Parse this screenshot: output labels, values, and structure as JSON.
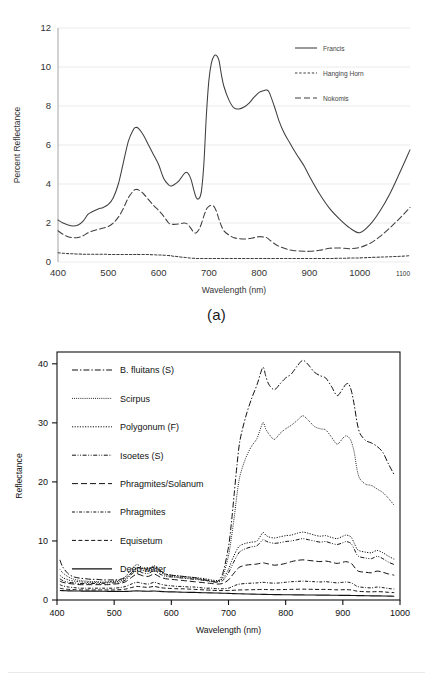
{
  "figure": {
    "panel_a_caption": "(a)",
    "panel_b_caption": "(b)"
  },
  "colors": {
    "ink": "#3f3f3f",
    "ink_dark": "#111111",
    "grid": "#e2e2e2",
    "axis": "#8a8a8a",
    "background": "#ffffff"
  },
  "chart_data": [
    {
      "id": "panel-a",
      "type": "line",
      "title": "",
      "xlabel": "Wavelength (nm)",
      "ylabel": "Percent Reflectance",
      "xlim": [
        400,
        1100
      ],
      "ylim": [
        0,
        12
      ],
      "xticks": [
        400,
        500,
        600,
        700,
        800,
        900,
        1000,
        1100
      ],
      "yticks": [
        0,
        2,
        4,
        6,
        8,
        10,
        12
      ],
      "grid": "horizontal",
      "legend_position": "top-right",
      "x": [
        400,
        410,
        420,
        430,
        440,
        450,
        460,
        470,
        480,
        490,
        500,
        510,
        520,
        530,
        540,
        550,
        555,
        560,
        570,
        580,
        590,
        600,
        610,
        620,
        625,
        630,
        640,
        650,
        655,
        660,
        665,
        670,
        675,
        680,
        685,
        690,
        695,
        700,
        705,
        710,
        715,
        720,
        725,
        730,
        740,
        750,
        760,
        770,
        780,
        790,
        800,
        810,
        815,
        820,
        830,
        840,
        850,
        860,
        870,
        880,
        890,
        900,
        920,
        940,
        960,
        980,
        1000,
        1020,
        1040,
        1060,
        1080,
        1100
      ],
      "series": [
        {
          "name": "Francis",
          "style": "solid",
          "values": [
            2.15,
            2.0,
            1.9,
            1.85,
            1.9,
            2.1,
            2.45,
            2.6,
            2.72,
            2.8,
            2.95,
            3.3,
            4.0,
            5.1,
            6.2,
            6.8,
            6.9,
            6.85,
            6.5,
            6.0,
            5.5,
            5.0,
            4.3,
            3.95,
            3.9,
            3.95,
            4.15,
            4.5,
            4.6,
            4.5,
            4.2,
            3.7,
            3.3,
            3.25,
            3.6,
            5.0,
            7.5,
            9.3,
            10.2,
            10.55,
            10.6,
            10.35,
            9.6,
            9.0,
            8.3,
            7.9,
            7.85,
            7.95,
            8.15,
            8.45,
            8.7,
            8.8,
            8.82,
            8.7,
            8.0,
            7.2,
            6.6,
            6.15,
            5.7,
            5.3,
            4.9,
            4.4,
            3.5,
            2.75,
            2.2,
            1.75,
            1.5,
            1.9,
            2.6,
            3.5,
            4.6,
            5.75
          ],
          "peaks": [
            {
              "x": 555,
              "y": 6.9
            },
            {
              "x": 715,
              "y": 10.6
            },
            {
              "x": 815,
              "y": 8.82
            }
          ],
          "minima": [
            {
              "x": 430,
              "y": 1.85
            },
            {
              "x": 675,
              "y": 3.25
            },
            {
              "x": 980,
              "y": 1.5
            }
          ]
        },
        {
          "name": "Hanging Horn",
          "style": "dashed-short",
          "values": [
            0.47,
            0.45,
            0.43,
            0.42,
            0.41,
            0.4,
            0.4,
            0.4,
            0.4,
            0.4,
            0.39,
            0.39,
            0.39,
            0.39,
            0.39,
            0.39,
            0.39,
            0.39,
            0.38,
            0.38,
            0.37,
            0.36,
            0.35,
            0.33,
            0.32,
            0.3,
            0.27,
            0.24,
            0.23,
            0.21,
            0.2,
            0.19,
            0.18,
            0.18,
            0.18,
            0.18,
            0.18,
            0.18,
            0.18,
            0.18,
            0.18,
            0.18,
            0.18,
            0.18,
            0.18,
            0.18,
            0.18,
            0.18,
            0.18,
            0.18,
            0.18,
            0.18,
            0.18,
            0.18,
            0.18,
            0.18,
            0.18,
            0.18,
            0.18,
            0.18,
            0.18,
            0.18,
            0.18,
            0.18,
            0.19,
            0.2,
            0.21,
            0.23,
            0.25,
            0.27,
            0.29,
            0.32
          ]
        },
        {
          "name": "Nokomis",
          "style": "dashed-long",
          "values": [
            1.6,
            1.42,
            1.3,
            1.25,
            1.26,
            1.35,
            1.5,
            1.6,
            1.68,
            1.74,
            1.82,
            2.0,
            2.3,
            2.75,
            3.3,
            3.65,
            3.72,
            3.7,
            3.5,
            3.2,
            2.9,
            2.65,
            2.35,
            2.0,
            1.95,
            1.93,
            1.95,
            2.0,
            1.98,
            1.88,
            1.7,
            1.52,
            1.5,
            1.65,
            1.95,
            2.35,
            2.7,
            2.85,
            2.9,
            2.85,
            2.6,
            2.2,
            1.85,
            1.6,
            1.38,
            1.25,
            1.2,
            1.18,
            1.2,
            1.25,
            1.3,
            1.28,
            1.25,
            1.15,
            0.95,
            0.8,
            0.7,
            0.62,
            0.58,
            0.56,
            0.55,
            0.55,
            0.6,
            0.7,
            0.72,
            0.68,
            0.75,
            0.95,
            1.3,
            1.75,
            2.25,
            2.8
          ],
          "peaks": [
            {
              "x": 555,
              "y": 3.72
            },
            {
              "x": 705,
              "y": 2.9
            }
          ]
        }
      ]
    },
    {
      "id": "panel-b",
      "type": "line",
      "title": "",
      "xlabel": "Wavelength (nm)",
      "ylabel": "Reflectance",
      "xlim": [
        400,
        1000
      ],
      "ylim": [
        0,
        42
      ],
      "xticks": [
        400,
        500,
        600,
        700,
        800,
        900,
        1000
      ],
      "yticks": [
        0,
        10,
        20,
        30,
        40
      ],
      "grid": "none",
      "legend_position": "upper-left-inside",
      "x": [
        405,
        410,
        420,
        430,
        440,
        450,
        460,
        470,
        480,
        490,
        500,
        510,
        520,
        530,
        540,
        550,
        560,
        570,
        580,
        590,
        600,
        610,
        620,
        630,
        640,
        650,
        660,
        670,
        680,
        690,
        700,
        705,
        710,
        715,
        720,
        730,
        740,
        750,
        760,
        765,
        770,
        780,
        790,
        800,
        810,
        820,
        830,
        840,
        850,
        860,
        870,
        880,
        890,
        900,
        905,
        910,
        915,
        920,
        925,
        930,
        940,
        950,
        960,
        970,
        980,
        990
      ],
      "series": [
        {
          "name": "B. fluitans (S)",
          "style": "dash-dot",
          "values": [
            6.8,
            5.6,
            4.4,
            3.9,
            3.7,
            3.6,
            3.5,
            3.5,
            3.4,
            3.4,
            3.4,
            3.5,
            3.8,
            4.6,
            5.5,
            5.3,
            5.2,
            5.6,
            5.0,
            4.4,
            4.2,
            4.1,
            4.0,
            3.9,
            3.8,
            3.6,
            3.4,
            3.2,
            3.1,
            4.5,
            9.0,
            13.0,
            18.0,
            23.0,
            27.0,
            31.0,
            34.0,
            36.5,
            39.4,
            38.0,
            36.6,
            35.6,
            36.6,
            37.6,
            38.3,
            39.6,
            40.6,
            39.8,
            38.6,
            38.0,
            37.6,
            36.2,
            34.6,
            35.8,
            36.5,
            36.6,
            35.4,
            33.0,
            30.0,
            28.2,
            27.0,
            26.6,
            26.0,
            25.0,
            23.0,
            21.2
          ],
          "peaks": [
            {
              "x": 760,
              "y": 39.4
            },
            {
              "x": 830,
              "y": 40.6
            },
            {
              "x": 908,
              "y": 36.6
            }
          ]
        },
        {
          "name": "Scirpus",
          "style": "dotted-fine",
          "values": [
            5.2,
            4.6,
            3.9,
            3.5,
            3.3,
            3.2,
            3.1,
            3.1,
            3.0,
            3.0,
            3.1,
            3.2,
            3.6,
            4.5,
            5.4,
            5.0,
            4.9,
            5.4,
            4.8,
            4.2,
            4.0,
            3.9,
            3.8,
            3.7,
            3.6,
            3.5,
            3.3,
            3.1,
            3.0,
            4.0,
            7.5,
            10.5,
            14.0,
            18.0,
            21.0,
            24.0,
            26.0,
            27.4,
            30.0,
            29.0,
            28.2,
            27.2,
            28.2,
            29.0,
            29.6,
            30.4,
            31.2,
            30.4,
            29.4,
            29.0,
            28.8,
            27.6,
            26.4,
            27.4,
            27.8,
            27.6,
            26.8,
            25.0,
            22.0,
            20.5,
            19.6,
            19.4,
            18.8,
            18.2,
            17.2,
            16.0
          ],
          "peaks": [
            {
              "x": 765,
              "y": 30.0
            },
            {
              "x": 830,
              "y": 31.2
            },
            {
              "x": 905,
              "y": 27.8
            }
          ]
        },
        {
          "name": "Polygonum (F)",
          "style": "dotted",
          "values": [
            4.2,
            3.8,
            3.4,
            3.2,
            3.1,
            3.0,
            3.0,
            3.0,
            3.0,
            3.1,
            3.2,
            3.4,
            4.0,
            5.2,
            6.0,
            5.4,
            5.3,
            5.8,
            5.0,
            4.4,
            4.2,
            4.1,
            4.0,
            3.9,
            3.8,
            3.7,
            3.6,
            3.4,
            3.3,
            3.6,
            5.2,
            6.5,
            7.6,
            8.6,
            9.2,
            9.6,
            9.8,
            10.0,
            11.4,
            11.0,
            10.7,
            10.5,
            10.7,
            10.9,
            11.0,
            11.3,
            11.5,
            11.3,
            11.0,
            10.8,
            10.9,
            10.6,
            10.4,
            10.8,
            11.0,
            10.9,
            10.6,
            9.6,
            8.6,
            8.3,
            8.1,
            8.0,
            8.4,
            8.0,
            7.4,
            6.9
          ],
          "peaks": [
            {
              "x": 760,
              "y": 11.4
            },
            {
              "x": 830,
              "y": 11.5
            }
          ]
        },
        {
          "name": "Isoetes (S)",
          "style": "dash-dot-dot",
          "values": [
            3.6,
            3.3,
            3.0,
            2.9,
            2.8,
            2.8,
            2.8,
            2.8,
            2.8,
            2.9,
            2.9,
            3.0,
            3.4,
            4.3,
            5.0,
            4.6,
            4.5,
            5.0,
            4.4,
            4.0,
            3.9,
            3.8,
            3.7,
            3.6,
            3.5,
            3.4,
            3.3,
            3.2,
            3.1,
            3.3,
            4.6,
            5.6,
            6.6,
            7.5,
            8.2,
            8.7,
            9.0,
            9.2,
            10.2,
            10.0,
            9.8,
            9.6,
            9.7,
            9.9,
            10.0,
            10.2,
            10.4,
            10.2,
            10.0,
            9.8,
            9.9,
            9.6,
            9.4,
            9.7,
            9.9,
            9.8,
            9.5,
            8.6,
            7.6,
            7.3,
            7.1,
            7.0,
            7.4,
            7.0,
            6.4,
            6.0
          ],
          "peaks": [
            {
              "x": 760,
              "y": 10.2
            },
            {
              "x": 830,
              "y": 10.4
            }
          ]
        },
        {
          "name": "Phragmites/Solanum",
          "style": "dashed-long",
          "values": [
            3.2,
            3.0,
            2.8,
            2.7,
            2.6,
            2.6,
            2.6,
            2.6,
            2.6,
            2.6,
            2.7,
            2.8,
            3.1,
            3.8,
            4.4,
            4.1,
            4.0,
            4.4,
            3.9,
            3.6,
            3.5,
            3.4,
            3.3,
            3.2,
            3.1,
            3.0,
            2.9,
            2.8,
            2.7,
            2.8,
            3.4,
            4.0,
            4.6,
            5.2,
            5.6,
            5.9,
            6.0,
            6.1,
            6.3,
            6.2,
            6.1,
            5.9,
            6.0,
            6.2,
            6.5,
            6.7,
            6.8,
            6.7,
            6.6,
            6.5,
            6.6,
            6.4,
            6.2,
            6.4,
            6.5,
            6.4,
            6.2,
            5.6,
            5.0,
            4.8,
            4.7,
            4.6,
            4.9,
            4.7,
            4.4,
            4.2
          ],
          "peaks": [
            {
              "x": 830,
              "y": 6.8
            }
          ]
        },
        {
          "name": "Phragmites",
          "style": "dash-dot-fine",
          "values": [
            2.6,
            2.4,
            2.2,
            2.1,
            2.0,
            2.0,
            2.0,
            2.0,
            2.0,
            2.0,
            2.0,
            2.1,
            2.3,
            2.7,
            3.0,
            2.8,
            2.7,
            3.0,
            2.7,
            2.5,
            2.4,
            2.3,
            2.3,
            2.2,
            2.2,
            2.1,
            2.0,
            2.0,
            1.9,
            1.9,
            2.0,
            2.2,
            2.4,
            2.6,
            2.7,
            2.8,
            2.85,
            2.9,
            3.0,
            2.95,
            2.9,
            2.85,
            2.9,
            3.0,
            3.1,
            3.15,
            3.2,
            3.15,
            3.1,
            3.05,
            3.1,
            3.0,
            2.9,
            3.0,
            3.05,
            3.0,
            2.9,
            2.6,
            2.3,
            2.2,
            2.1,
            2.05,
            2.2,
            2.1,
            1.95,
            1.85
          ],
          "peaks": [
            {
              "x": 830,
              "y": 3.2
            }
          ]
        },
        {
          "name": "Equisetum",
          "style": "dashed-medium",
          "values": [
            2.0,
            1.9,
            1.8,
            1.75,
            1.7,
            1.7,
            1.7,
            1.7,
            1.7,
            1.7,
            1.7,
            1.75,
            1.85,
            2.1,
            2.3,
            2.2,
            2.15,
            2.3,
            2.1,
            2.0,
            1.95,
            1.9,
            1.9,
            1.85,
            1.8,
            1.75,
            1.7,
            1.65,
            1.6,
            1.6,
            1.6,
            1.62,
            1.65,
            1.68,
            1.7,
            1.72,
            1.74,
            1.76,
            1.8,
            1.78,
            1.76,
            1.74,
            1.76,
            1.78,
            1.8,
            1.82,
            1.84,
            1.82,
            1.8,
            1.78,
            1.8,
            1.76,
            1.72,
            1.74,
            1.76,
            1.74,
            1.7,
            1.6,
            1.5,
            1.45,
            1.4,
            1.38,
            1.42,
            1.38,
            1.3,
            1.25
          ]
        },
        {
          "name": "Deep water",
          "style": "solid",
          "values": [
            1.6,
            1.58,
            1.55,
            1.53,
            1.52,
            1.5,
            1.5,
            1.5,
            1.48,
            1.47,
            1.46,
            1.45,
            1.45,
            1.5,
            1.55,
            1.5,
            1.48,
            1.52,
            1.45,
            1.4,
            1.38,
            1.35,
            1.32,
            1.3,
            1.28,
            1.25,
            1.22,
            1.2,
            1.18,
            1.15,
            1.12,
            1.1,
            1.08,
            1.06,
            1.05,
            1.02,
            1.0,
            0.98,
            0.96,
            0.95,
            0.94,
            0.92,
            0.9,
            0.89,
            0.88,
            0.87,
            0.86,
            0.85,
            0.84,
            0.83,
            0.82,
            0.81,
            0.8,
            0.79,
            0.78,
            0.78,
            0.77,
            0.76,
            0.75,
            0.74,
            0.72,
            0.71,
            0.7,
            0.68,
            0.66,
            0.64
          ]
        }
      ]
    }
  ]
}
